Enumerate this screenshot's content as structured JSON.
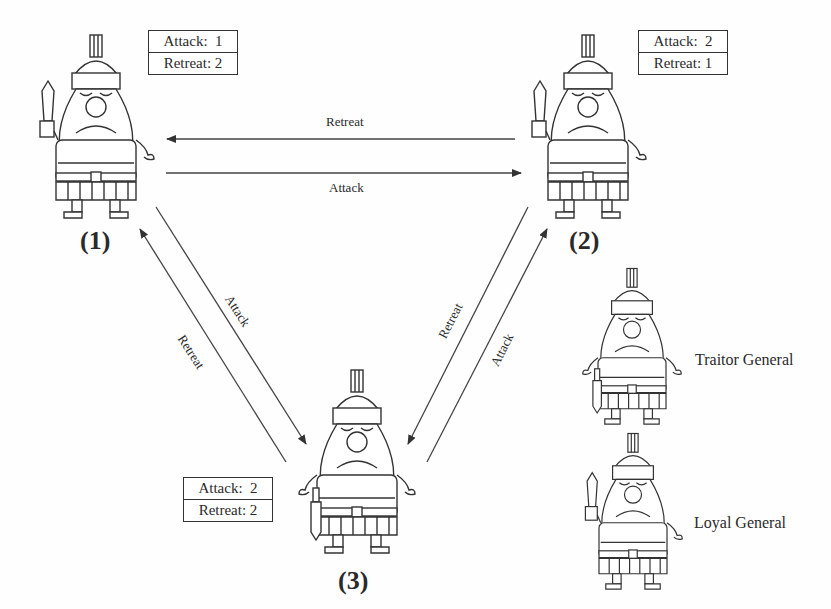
{
  "diagram": {
    "nodes": [
      {
        "id": "1",
        "label": "(1)",
        "type": "loyal",
        "votes": {
          "attack_label": "Attack:",
          "attack": "1",
          "retreat_label": "Retreat:",
          "retreat": "2"
        }
      },
      {
        "id": "2",
        "label": "(2)",
        "type": "loyal",
        "votes": {
          "attack_label": "Attack:",
          "attack": "2",
          "retreat_label": "Retreat:",
          "retreat": "1"
        }
      },
      {
        "id": "3",
        "label": "(3)",
        "type": "traitor",
        "votes": {
          "attack_label": "Attack:",
          "attack": "2",
          "retreat_label": "Retreat:",
          "retreat": "2"
        }
      }
    ],
    "edges": [
      {
        "from": "2",
        "to": "1",
        "label": "Retreat"
      },
      {
        "from": "1",
        "to": "2",
        "label": "Attack"
      },
      {
        "from": "1",
        "to": "3",
        "label": "Attack"
      },
      {
        "from": "3",
        "to": "1",
        "label": "Retreat"
      },
      {
        "from": "2",
        "to": "3",
        "label": "Retreat"
      },
      {
        "from": "3",
        "to": "2",
        "label": "Attack"
      }
    ],
    "legend": [
      {
        "type": "traitor",
        "label": "Traitor General"
      },
      {
        "type": "loyal",
        "label": "Loyal General"
      }
    ]
  }
}
